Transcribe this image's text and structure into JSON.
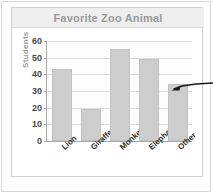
{
  "chart_data": {
    "type": "bar",
    "title": "Favorite Zoo Animal",
    "xlabel": "",
    "ylabel": "Students",
    "categories": [
      "Lion",
      "Giraffe",
      "Monkey",
      "Elephant",
      "Other"
    ],
    "values": [
      43,
      19,
      55,
      49,
      34
    ],
    "ylim": [
      0,
      60
    ],
    "ytick_labels": [
      "0",
      "10",
      "20",
      "30",
      "40",
      "50",
      "60"
    ],
    "ytick_values": [
      0,
      10,
      20,
      30,
      40,
      50,
      60
    ],
    "grid": true,
    "legend": false,
    "bar_color": "#cdcdcd",
    "title_color": "#9a9a9a",
    "axis_color": "#a8a8a8",
    "annotations": [
      {
        "name": "arrow-pointing-to-other-bar",
        "target_category": "Other",
        "label": ""
      }
    ]
  }
}
